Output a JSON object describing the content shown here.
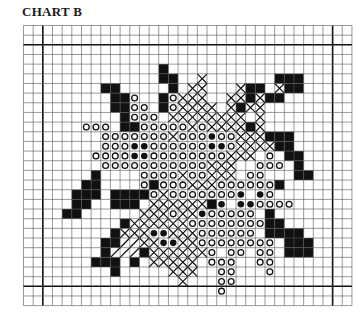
{
  "title": "CHART B",
  "legend_codes": {
    ".": "empty",
    "#": "filled-black",
    "o": "open-circle",
    "*": "solid-dot",
    "x": "cross-stitch",
    "/": "diagonal-hatch"
  },
  "colors": {
    "ink": "#111111",
    "grid": "#555555",
    "paper": "#ffffff"
  },
  "chart_data": {
    "type": "heatmap",
    "title": "CHART B",
    "cols": 34,
    "rows": 29,
    "cell_px": 9.66,
    "bold_lines": {
      "cols": [
        2,
        32
      ],
      "rows": [
        2,
        27
      ]
    },
    "grid": [
      "..................................",
      "..................................",
      "..................................",
      "..................................",
      "..............#...................",
      "..............##..x.......###.....",
      "........##.....#.xx...x##.x##.....",
      ".........##o..#oxxx..xx#x##.......",
      ".........##oo.#oxxxx.x#xx.........",
      "..........#ooo.xxxxxxxx.x.........",
      "......ooo.##oooooxoxxxx#x.........",
      "........oooooooxooo*ooxxx###......",
      "........ooo**oooooo**oxxxx##......",
      ".......oooo**ooooooooxxx.o.##.....",
      "........oooooooooooxxx..ooo.#.....",
      ".......#....ooooxooxxx.oo...##....",
      "......##....o#oooxxxoooooo#.......",
      ".....###.####oxooooooo*.*o........",
      ".....##..###.xxxxxx#*.**oooo......",
      "....##......xxxoxx*ooooo.#........",
      "..........#xxxxxxoooooooo##.......",
      ".........#xxx**xxxoooooo.####.....",
      "........##//xx**xxoooooooo.###....",
      "........#///#xxxxxxo.oo.oo.###....",
      ".......###.#.xxxxx.ooo..oo........",
      ".........#.....xxx..oo...o........",
      "................x...oo............",
      "....................o.............",
      ".................................."
    ]
  }
}
